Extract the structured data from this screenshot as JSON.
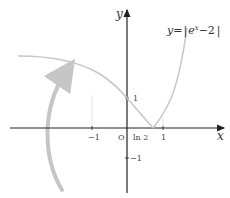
{
  "figure": {
    "equation_label": "y=|e^x−2|",
    "equation_parts": {
      "lhs": "y",
      "eq": "=",
      "bar": "|",
      "base": "e",
      "exp": "x",
      "rest": "−2",
      "bar2": "|"
    },
    "axis_labels": {
      "x": "x",
      "y": "y"
    },
    "origin_label": "O",
    "x_ticks": [
      "−1",
      "ln 2",
      "1"
    ],
    "y_ticks": [
      "1",
      "−1"
    ],
    "colors": {
      "axis": "#222222",
      "curve": "#c8c8c8",
      "arrow": "#c6c6c6",
      "guide": "#d8d8d8"
    }
  }
}
